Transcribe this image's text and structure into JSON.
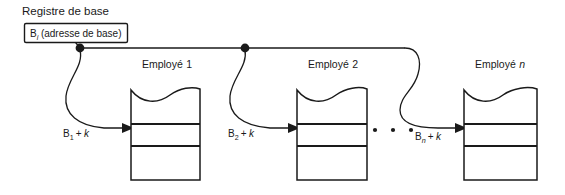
{
  "diagram": {
    "title": "Registre de base",
    "register": {
      "base_symbol": "B",
      "base_subscript": "i",
      "base_description": "(adresse de base)"
    },
    "bus": {
      "junction_count": 2,
      "ellipsis": "• • •"
    },
    "records": [
      {
        "caption_prefix": "Employé",
        "caption_index": "1",
        "caption_index_italic": false,
        "offset_symbol": "B",
        "offset_subscript": "1",
        "offset_operator": "+",
        "offset_term": "k"
      },
      {
        "caption_prefix": "Employé",
        "caption_index": "2",
        "caption_index_italic": false,
        "offset_symbol": "B",
        "offset_subscript": "2",
        "offset_operator": "+",
        "offset_term": "k"
      },
      {
        "caption_prefix": "Employé",
        "caption_index": "n",
        "caption_index_italic": true,
        "offset_symbol": "B",
        "offset_subscript": "n",
        "offset_operator": "+",
        "offset_term": "k"
      }
    ],
    "colors": {
      "ink": "#1a1a1a",
      "background": "#ffffff"
    }
  }
}
